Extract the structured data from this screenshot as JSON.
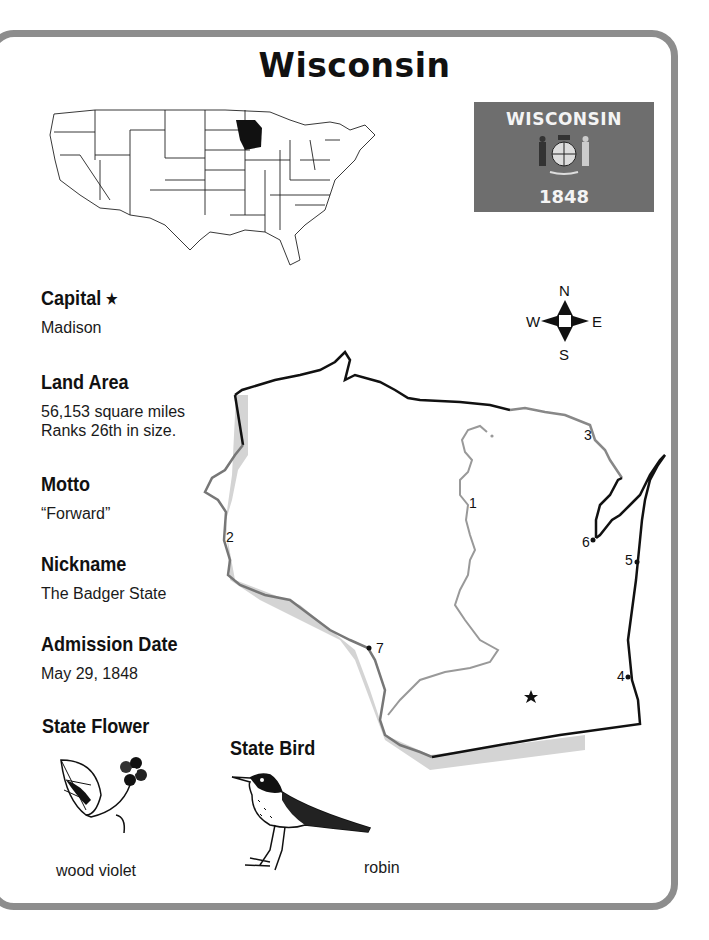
{
  "title": "Wisconsin",
  "us_map": {
    "highlighted_state": "Wisconsin",
    "icon": "us-map-locator"
  },
  "flag": {
    "name": "WISCONSIN",
    "year": "1848",
    "color": "#6e6e6e"
  },
  "facts": [
    {
      "heading": "Capital",
      "heading_icon": "★",
      "lines": [
        "Madison"
      ]
    },
    {
      "heading": "Land Area",
      "lines": [
        "56,153 square miles",
        "Ranks 26th in size."
      ]
    },
    {
      "heading": "Motto",
      "lines": [
        "“Forward”"
      ]
    },
    {
      "heading": "Nickname",
      "lines": [
        "The Badger State"
      ]
    },
    {
      "heading": "Admission Date",
      "lines": [
        "May 29, 1848"
      ]
    }
  ],
  "state_flower": {
    "heading": "State Flower",
    "caption": "wood violet"
  },
  "state_bird": {
    "heading": "State Bird",
    "caption": "robin"
  },
  "compass": {
    "n": "N",
    "s": "S",
    "e": "E",
    "w": "W"
  },
  "map_labels": [
    "1",
    "2",
    "3",
    "4",
    "5",
    "6",
    "7"
  ],
  "capital_marker": "★",
  "colors": {
    "border": "#8d8d8d",
    "water_shadow": "#d0d0d0",
    "river": "#8a8a8a"
  }
}
